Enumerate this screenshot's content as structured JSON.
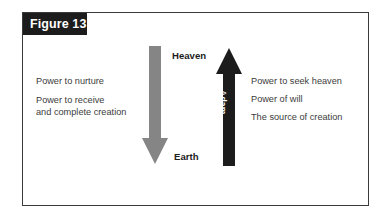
{
  "figure": {
    "banner_label": "Figure 13",
    "banner_bg": "#1c1c1c",
    "banner_text_color": "#ffffff",
    "frame_border_color": "#3a3a3a",
    "background": "#ffffff"
  },
  "poles": {
    "top_label": "Heaven",
    "bottom_label": "Earth",
    "label_color": "#1c1c1c"
  },
  "arrows": [
    {
      "id": "eve",
      "caption": "Eve",
      "direction": "down",
      "color": "#858585",
      "caption_color": "#ffffff",
      "from": "Heaven",
      "to": "Earth"
    },
    {
      "id": "adam",
      "caption": "Adam",
      "direction": "up",
      "color": "#1c1c1c",
      "caption_color": "#ffffff",
      "from": "Earth",
      "to": "Heaven"
    }
  ],
  "left_column": {
    "attributed_to": "Eve",
    "items": [
      {
        "line1": "Power to nurture",
        "line2": ""
      },
      {
        "line1": "Power to receive",
        "line2": "and complete creation"
      }
    ]
  },
  "right_column": {
    "attributed_to": "Adam",
    "items": [
      "Power to seek heaven",
      "Power of will",
      "The source of creation"
    ]
  },
  "text_color": "#3c3c3c"
}
